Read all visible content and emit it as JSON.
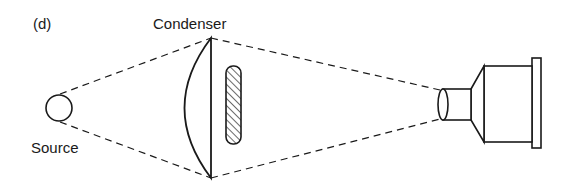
{
  "figure": {
    "panel_label": "(d)",
    "labels": {
      "condenser": "Condenser",
      "source": "Source"
    },
    "components": [
      "light source",
      "condenser lens",
      "slide",
      "projection lens"
    ],
    "colors": {
      "ink": "#1a1a1a",
      "background": "#ffffff"
    }
  }
}
